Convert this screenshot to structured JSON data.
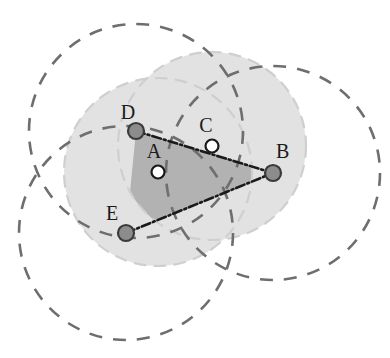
{
  "figure": {
    "background": "#ffffff",
    "width": 390,
    "height": 358
  },
  "colors": {
    "dark_dash": "#6e6e6e",
    "light_dash": "#cfcfcf",
    "light_fill": "#e2e2e2",
    "dark_fill": "#b0b0b0",
    "node_fill": "#8c8c8c",
    "node_stroke": "#3a3a3a",
    "hollow_fill": "#ffffff",
    "line": "#1a1a1a",
    "label_text": "#1a1a1a"
  },
  "points": [
    {
      "id": "A",
      "label": "A",
      "cx": 158,
      "cy": 172,
      "r": 6.5,
      "style": "hollow",
      "label_x": 154,
      "label_y": 158
    },
    {
      "id": "B",
      "label": "B",
      "cx": 273,
      "cy": 173,
      "r": 8.0,
      "style": "filled",
      "label_x": 276,
      "label_y": 158
    },
    {
      "id": "C",
      "label": "C",
      "cx": 212,
      "cy": 146,
      "r": 6.5,
      "style": "hollow",
      "label_x": 206,
      "label_y": 132
    },
    {
      "id": "D",
      "label": "D",
      "cx": 136,
      "cy": 131,
      "r": 8.0,
      "style": "filled",
      "label_x": 128,
      "label_y": 119
    },
    {
      "id": "E",
      "label": "E",
      "cx": 126,
      "cy": 233,
      "r": 8.0,
      "style": "filled",
      "label_x": 112,
      "label_y": 220
    }
  ],
  "circles": [
    {
      "id": "circle-D",
      "center": "D",
      "cx": 136,
      "cy": 131,
      "r": 107,
      "tone": "dark"
    },
    {
      "id": "circle-E",
      "center": "E",
      "cx": 126,
      "cy": 233,
      "r": 107,
      "tone": "dark"
    },
    {
      "id": "circle-B",
      "center": "B",
      "cx": 273,
      "cy": 173,
      "r": 107,
      "tone": "dark"
    },
    {
      "id": "circle-A",
      "center": "A",
      "cx": 158,
      "cy": 172,
      "r": 94,
      "tone": "light"
    },
    {
      "id": "circle-C",
      "center": "C",
      "cx": 212,
      "cy": 146,
      "r": 94,
      "tone": "light"
    }
  ],
  "edges": [
    {
      "id": "edge-D-B",
      "from": "D",
      "to": "B",
      "x1": 136,
      "y1": 131,
      "x2": 273,
      "y2": 173
    },
    {
      "id": "edge-E-B",
      "from": "E",
      "to": "B",
      "x1": 126,
      "y1": 233,
      "x2": 273,
      "y2": 173
    }
  ],
  "regions": [
    {
      "id": "light-coverage",
      "fill": "#e2e2e2",
      "description": "union of light dashed circles A and C"
    },
    {
      "id": "dark-overlap",
      "fill": "#b0b0b0",
      "description": "intersection wedge bounded by arcs and edges to B"
    }
  ],
  "legend_note": ""
}
